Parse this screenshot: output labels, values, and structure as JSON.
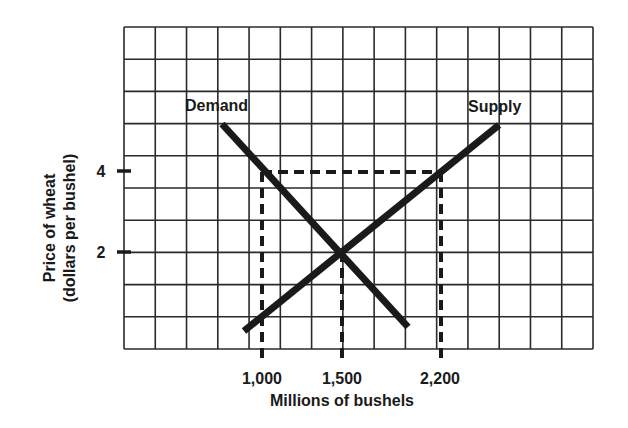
{
  "chart_data": {
    "type": "line",
    "title": "",
    "xlabel": "Millions of bushels",
    "ylabel": "Price of wheat",
    "ylabel_sub": "(dollars per bushel)",
    "x_ticks": [
      {
        "value": 1000,
        "label": "1,000"
      },
      {
        "value": 1500,
        "label": "1,500"
      },
      {
        "value": 2200,
        "label": "2,200"
      }
    ],
    "y_ticks": [
      {
        "value": 4,
        "label": "4"
      },
      {
        "value": 2,
        "label": "2"
      }
    ],
    "grid": true,
    "grid_columns": 15,
    "grid_rows": 10,
    "series": [
      {
        "name": "Demand",
        "label": "Demand",
        "points": [
          [
            820,
            5.0
          ],
          [
            1500,
            2.0
          ],
          [
            1900,
            0.3
          ]
        ]
      },
      {
        "name": "Supply",
        "label": "Supply",
        "points": [
          [
            900,
            0.2
          ],
          [
            1000,
            0.6
          ],
          [
            1500,
            2.0
          ],
          [
            2200,
            4.0
          ],
          [
            2350,
            4.5
          ]
        ]
      }
    ],
    "reference_lines": [
      {
        "type": "horizontal",
        "y": 4,
        "x_from": 1000,
        "x_to": 2200,
        "style": "dashed"
      },
      {
        "type": "vertical",
        "x": 1000,
        "style": "dashed",
        "label": "1,000"
      },
      {
        "type": "vertical",
        "x": 1500,
        "style": "dashed",
        "label": "1,500"
      },
      {
        "type": "vertical",
        "x": 2200,
        "style": "dashed",
        "label": "2,200"
      }
    ],
    "equilibrium": {
      "quantity": 1500,
      "price": 2
    }
  }
}
